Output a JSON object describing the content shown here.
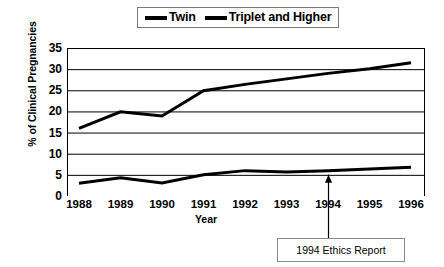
{
  "chart_data": {
    "type": "line",
    "title": "",
    "xlabel": "Year",
    "ylabel": "% of Clinical Pregnancies",
    "categories": [
      1988,
      1989,
      1990,
      1991,
      1992,
      1993,
      1994,
      1995,
      1996
    ],
    "xtick_labels": [
      "1988",
      "1989",
      "1990",
      "1991",
      "1992",
      "1993",
      "1994",
      "1995",
      "1996"
    ],
    "ytick_labels": [
      "0",
      "5",
      "10",
      "15",
      "20",
      "25",
      "30",
      "35"
    ],
    "ytick_values": [
      0,
      5,
      10,
      15,
      20,
      25,
      30,
      35
    ],
    "ylim": [
      0,
      35
    ],
    "grid": true,
    "grid_axis": "y",
    "legend_position": "top-center",
    "series": [
      {
        "name": "Twin",
        "color": "#000000",
        "values": [
          16.0,
          19.9,
          18.9,
          24.9,
          26.4,
          27.7,
          29.0,
          30.1,
          31.5
        ]
      },
      {
        "name": "Triplet and Higher",
        "color": "#000000",
        "values": [
          3.0,
          4.3,
          3.1,
          5.0,
          6.0,
          5.7,
          6.0,
          6.4,
          6.8
        ]
      }
    ],
    "annotations": [
      {
        "text": "1994 Ethics Report",
        "points_to_category": 1994,
        "arrow": "up"
      }
    ]
  },
  "legend": {
    "items": [
      {
        "label": "Twin",
        "marker": "line-marker"
      },
      {
        "label": "Triplet and Higher",
        "marker": "line-marker"
      }
    ]
  },
  "axes": {
    "y_title": "% of Clinical Pregnancies",
    "x_title": "Year"
  },
  "annotation": {
    "text": "1994 Ethics Report"
  }
}
